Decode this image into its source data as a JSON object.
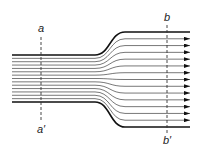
{
  "diagram": {
    "sections": [
      {
        "id": "a",
        "top_label": "a",
        "bottom_label": "a′",
        "x": 41
      },
      {
        "id": "b",
        "top_label": "b",
        "bottom_label": "b′",
        "x": 167
      }
    ],
    "inlet": {
      "x_start": 12,
      "x_end": 95,
      "y_top": 55,
      "y_bottom": 102
    },
    "outlet": {
      "x_start": 125,
      "x_end": 190,
      "y_top": 32,
      "y_bottom": 127
    },
    "streamline_count": 15,
    "colors": {
      "wall": "#111111",
      "streamline": "#555555",
      "section_line": "#333333",
      "arrow": "#111111"
    }
  }
}
